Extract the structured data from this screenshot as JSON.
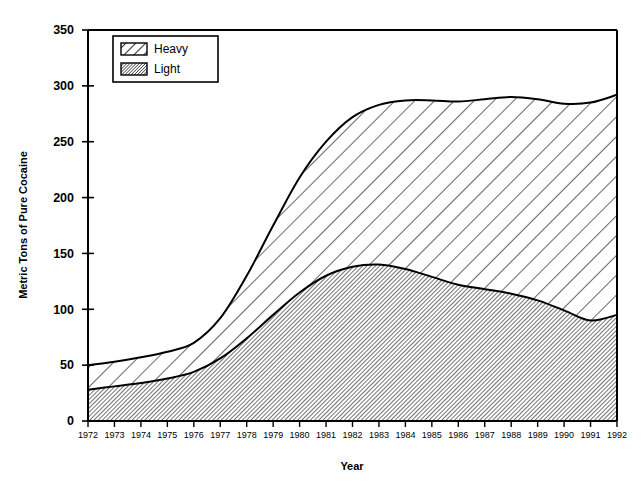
{
  "chart_data": {
    "type": "area",
    "title": "",
    "xlabel": "Year",
    "ylabel": "Metric Tons of Pure Cocaine",
    "stacked": true,
    "grid": false,
    "legend_position": "top-left inside plot",
    "xlim": [
      1972,
      1992
    ],
    "ylim": [
      0,
      350
    ],
    "ytick_step": 50,
    "ytick_labels": [
      "0",
      "50",
      "100",
      "150",
      "200",
      "250",
      "300",
      "350"
    ],
    "ytick_values": [
      0,
      50,
      100,
      150,
      200,
      250,
      300,
      350
    ],
    "categories": [
      1972,
      1973,
      1974,
      1975,
      1976,
      1977,
      1978,
      1979,
      1980,
      1981,
      1982,
      1983,
      1984,
      1985,
      1986,
      1987,
      1988,
      1989,
      1990,
      1991,
      1992
    ],
    "xtick_labels": [
      "1972",
      "1973",
      "1974",
      "1975",
      "1976",
      "1977",
      "1978",
      "1979",
      "1980",
      "1981",
      "1982",
      "1983",
      "1984",
      "1985",
      "1986",
      "1987",
      "1988",
      "1989",
      "1990",
      "1991",
      "1992"
    ],
    "series": [
      {
        "name": "Light",
        "pattern": "dense-diagonal-hatch",
        "values": [
          28,
          31,
          34,
          38,
          44,
          56,
          74,
          95,
          115,
          130,
          138,
          140,
          136,
          129,
          122,
          118,
          114,
          108,
          99,
          90,
          95
        ]
      },
      {
        "name": "Heavy",
        "pattern": "wide-diagonal-hatch",
        "values": [
          22,
          22,
          23,
          24,
          26,
          36,
          56,
          80,
          103,
          120,
          134,
          143,
          151,
          158,
          164,
          170,
          176,
          180,
          185,
          195,
          197
        ]
      }
    ],
    "totals": [
      50,
      53,
      57,
      62,
      70,
      92,
      130,
      175,
      218,
      250,
      272,
      283,
      287,
      287,
      286,
      288,
      290,
      288,
      284,
      285,
      292
    ],
    "legend": [
      {
        "label": "Heavy",
        "pattern": "wide-diagonal-hatch"
      },
      {
        "label": "Light",
        "pattern": "dense-diagonal-hatch"
      }
    ],
    "colors": {
      "line": "#000000",
      "fill": "#ffffff",
      "background": "#ffffff"
    }
  }
}
